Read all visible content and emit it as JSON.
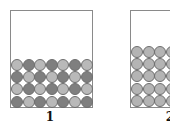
{
  "panels": [
    {
      "label": "1",
      "box": {
        "x": 10,
        "y": 10,
        "w": 83,
        "h": 98
      },
      "grid": {
        "cols": 7,
        "rows": 4,
        "ball_d": 12,
        "pitch_x": 11.6,
        "pitch_y": 12.2,
        "top": 59
      },
      "pattern": "checkerboard",
      "colors": {
        "light": "#b9b9b9",
        "dark": "#7f7f7f"
      },
      "label_pos": {
        "x": 40,
        "y": 110
      }
    },
    {
      "label": "2",
      "box": {
        "x": 130,
        "y": 10,
        "w": 60,
        "h": 98
      },
      "grid": {
        "cols": 4,
        "rows": 5,
        "ball_d": 12,
        "pitch_x": 11.6,
        "pitch_y": 12.2,
        "top": 46
      },
      "pattern": "uniform",
      "colors": {
        "light": "#b4b4b4",
        "dark": "#b4b4b4"
      },
      "label_pos": {
        "x": 160,
        "y": 110
      }
    }
  ]
}
